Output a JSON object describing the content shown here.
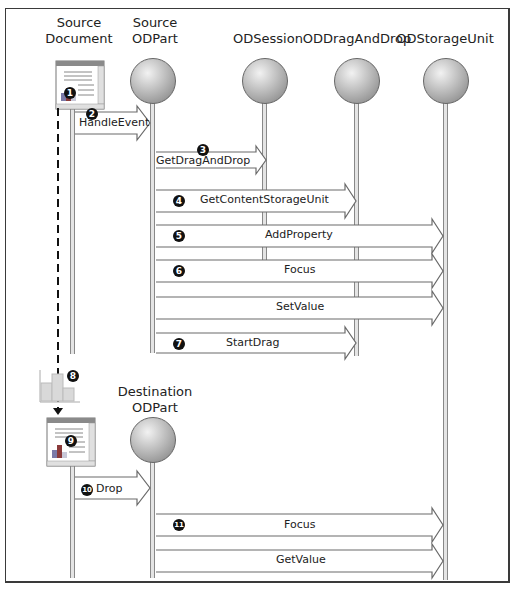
{
  "diagram": {
    "objects": [
      {
        "id": "source-document",
        "label": "Source\nDocument",
        "x": 79,
        "type": "document"
      },
      {
        "id": "source-odpart",
        "label": "Source\nODPart",
        "x": 152,
        "type": "ball"
      },
      {
        "id": "odsession",
        "label": "ODSession",
        "x": 264,
        "type": "ball"
      },
      {
        "id": "oddraganddrop",
        "label": "ODDragAndDrop",
        "x": 356,
        "type": "ball"
      },
      {
        "id": "odstorageunit",
        "label": "ODStorageUnit",
        "x": 445,
        "type": "ball"
      },
      {
        "id": "destination-odpart",
        "label": "Destination\nODPart",
        "x": 152,
        "type": "ball"
      }
    ],
    "messages": [
      {
        "step": "1",
        "label": "",
        "from": "source-document",
        "note": "user action in source document"
      },
      {
        "step": "2",
        "label": "HandleEvent",
        "from": "source-document",
        "to": "source-odpart"
      },
      {
        "step": "3",
        "label": "GetDragAndDrop",
        "from": "source-odpart",
        "to": "odsession"
      },
      {
        "step": "4",
        "label": "GetContentStorageUnit",
        "from": "source-odpart",
        "to": "oddraganddrop"
      },
      {
        "step": "5",
        "label": "AddProperty",
        "from": "source-odpart",
        "to": "odstorageunit"
      },
      {
        "step": "6",
        "label": "Focus",
        "from": "source-odpart",
        "to": "odstorageunit"
      },
      {
        "step": "",
        "label": "SetValue",
        "from": "source-odpart",
        "to": "odstorageunit"
      },
      {
        "step": "7",
        "label": "StartDrag",
        "from": "source-odpart",
        "to": "oddraganddrop"
      },
      {
        "step": "8",
        "label": "",
        "note": "dragged content icon"
      },
      {
        "step": "9",
        "label": "",
        "note": "destination document"
      },
      {
        "step": "10",
        "label": "Drop",
        "from": "destination-document",
        "to": "destination-odpart"
      },
      {
        "step": "11",
        "label": "Focus",
        "from": "destination-odpart",
        "to": "odstorageunit"
      },
      {
        "step": "",
        "label": "GetValue",
        "from": "destination-odpart",
        "to": "odstorageunit"
      }
    ],
    "colors": {
      "frame": "#3a3a3a",
      "arrow_fill": "#ffffff",
      "arrow_stroke": "#6a6a6a",
      "lifeline": "#e4e4e4",
      "badge": "#111111",
      "doc_titlebar": "#8a8a8a",
      "bar_dark": "#7a3a3a",
      "bar_mid": "#6a6aa0"
    }
  }
}
